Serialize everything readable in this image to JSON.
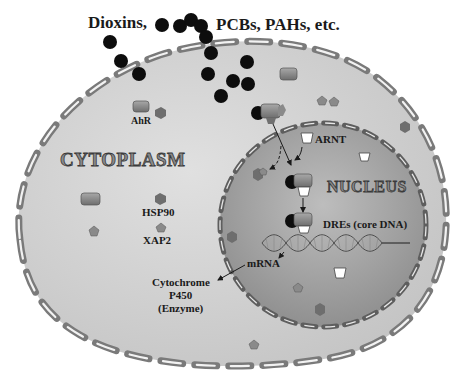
{
  "title": {
    "left": "Dioxins,",
    "right": "PCBs, PAHs, etc."
  },
  "compartments": {
    "cytoplasm": "CYTOPLASM",
    "nucleus": "NUCLEUS"
  },
  "labels": {
    "ahr": "AhR",
    "arnt": "ARNT",
    "hsp90": "HSP90",
    "xap2": "XAP2",
    "dres": "DREs (core DNA)",
    "mrna": "mRNA",
    "cyp_line1": "Cytochrome",
    "cyp_line2": "P450",
    "cyp_line3": "(Enzyme)"
  },
  "legend_colors": {
    "ligand": "#111111",
    "cell_fill": "#cfcfcf",
    "nucleus_fill": "#9a9a9a",
    "membrane": "#8a8a8a",
    "ahr_protein": "#8c8c8c",
    "arnt_protein": "#ffffff",
    "hsp90_hexagon": "#707070",
    "xap2_pentagon": "#8a8a8a"
  }
}
